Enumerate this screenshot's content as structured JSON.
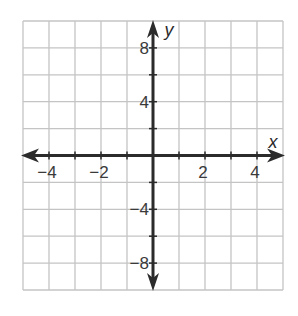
{
  "chart_data": {
    "type": "line",
    "title": "",
    "xlabel": "x",
    "ylabel": "y",
    "xlim": [
      -5,
      5
    ],
    "ylim": [
      -10,
      10
    ],
    "x_grid_step": 1,
    "y_grid_step": 2,
    "grid": true,
    "x_ticks": [
      {
        "value": -4,
        "label": "−4"
      },
      {
        "value": -2,
        "label": "−2"
      },
      {
        "value": 2,
        "label": "2"
      },
      {
        "value": 4,
        "label": "4"
      }
    ],
    "y_ticks": [
      {
        "value": 8,
        "label": "8"
      },
      {
        "value": 4,
        "label": "4"
      },
      {
        "value": -4,
        "label": "−4"
      },
      {
        "value": -8,
        "label": "−8"
      }
    ],
    "series": [],
    "colors": {
      "grid": "#c4c4c4",
      "axis": "#2b2b2b",
      "text": "#3a3a3a"
    }
  }
}
